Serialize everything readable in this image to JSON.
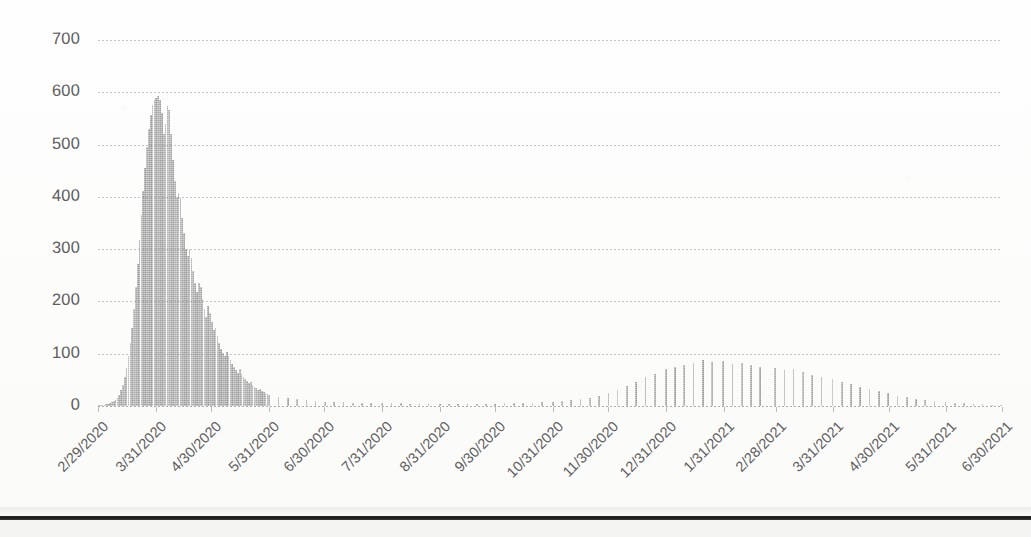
{
  "document": {
    "kind": "scanned-chart-page",
    "page_edge_visible": true
  },
  "chart": {
    "title": "",
    "bar_color": "#a2a2a2",
    "gridline_color": "#969696",
    "tick_label_color": "#5e5e5e"
  },
  "chart_data": {
    "type": "bar",
    "title": "",
    "subtitle": "",
    "xlabel": "",
    "ylabel": "",
    "ylim": [
      0,
      700
    ],
    "ytick_labels": [
      "700",
      "600",
      "500",
      "400",
      "300",
      "200",
      "100",
      "0"
    ],
    "ytick_values": [
      700,
      600,
      500,
      400,
      300,
      200,
      100,
      0
    ],
    "grid": true,
    "legend": "none",
    "xtick_labels": [
      "2/29/2020",
      "3/31/2020",
      "4/30/2020",
      "5/31/2020",
      "6/30/2020",
      "7/31/2020",
      "8/31/2020",
      "9/30/2020",
      "10/31/2020",
      "11/30/2020",
      "12/31/2020",
      "1/31/2021",
      "2/28/2021",
      "3/31/2021",
      "4/30/2021",
      "5/31/2021",
      "6/30/2021"
    ],
    "x_start": "2/29/2020",
    "x_end": "6/30/2021",
    "x_interval": "daily",
    "peak_value": 592,
    "peak_date": "4/1/2020",
    "second_wave_peak_value": 88,
    "second_wave_peak_date": "1/20/2021",
    "categories": [
      "2/29/2020",
      "3/1/2020",
      "3/2/2020",
      "3/3/2020",
      "3/4/2020",
      "3/5/2020",
      "3/6/2020",
      "3/7/2020",
      "3/8/2020",
      "3/9/2020",
      "3/10/2020",
      "3/11/2020",
      "3/12/2020",
      "3/13/2020",
      "3/14/2020",
      "3/15/2020",
      "3/16/2020",
      "3/17/2020",
      "3/18/2020",
      "3/19/2020",
      "3/20/2020",
      "3/21/2020",
      "3/22/2020",
      "3/23/2020",
      "3/24/2020",
      "3/25/2020",
      "3/26/2020",
      "3/27/2020",
      "3/28/2020",
      "3/29/2020",
      "3/30/2020",
      "3/31/2020",
      "4/1/2020",
      "4/2/2020",
      "4/3/2020",
      "4/4/2020",
      "4/5/2020",
      "4/6/2020",
      "4/7/2020",
      "4/8/2020",
      "4/9/2020",
      "4/10/2020",
      "4/11/2020",
      "4/12/2020",
      "4/13/2020",
      "4/14/2020",
      "4/15/2020",
      "4/16/2020",
      "4/17/2020",
      "4/18/2020",
      "4/19/2020",
      "4/20/2020",
      "4/21/2020",
      "4/22/2020",
      "4/23/2020",
      "4/24/2020",
      "4/25/2020",
      "4/26/2020",
      "4/27/2020",
      "4/28/2020",
      "4/29/2020",
      "4/30/2020",
      "5/1/2020",
      "5/2/2020",
      "5/3/2020",
      "5/4/2020",
      "5/5/2020",
      "5/6/2020",
      "5/7/2020",
      "5/8/2020",
      "5/9/2020",
      "5/10/2020",
      "5/11/2020",
      "5/12/2020",
      "5/13/2020",
      "5/14/2020",
      "5/15/2020",
      "5/16/2020",
      "5/17/2020",
      "5/18/2020",
      "5/19/2020",
      "5/20/2020",
      "5/21/2020",
      "5/22/2020",
      "5/23/2020",
      "5/24/2020",
      "5/25/2020",
      "5/26/2020",
      "5/27/2020",
      "5/28/2020",
      "5/29/2020",
      "5/30/2020",
      "5/31/2020",
      "6/5/2020",
      "6/10/2020",
      "6/15/2020",
      "6/20/2020",
      "6/25/2020",
      "6/30/2020",
      "7/5/2020",
      "7/10/2020",
      "7/15/2020",
      "7/20/2020",
      "7/25/2020",
      "7/31/2020",
      "8/5/2020",
      "8/10/2020",
      "8/15/2020",
      "8/20/2020",
      "8/25/2020",
      "8/31/2020",
      "9/5/2020",
      "9/10/2020",
      "9/15/2020",
      "9/20/2020",
      "9/25/2020",
      "9/30/2020",
      "10/5/2020",
      "10/10/2020",
      "10/15/2020",
      "10/20/2020",
      "10/25/2020",
      "10/31/2020",
      "11/5/2020",
      "11/10/2020",
      "11/15/2020",
      "11/20/2020",
      "11/25/2020",
      "11/30/2020",
      "12/5/2020",
      "12/10/2020",
      "12/15/2020",
      "12/20/2020",
      "12/25/2020",
      "12/31/2020",
      "1/5/2021",
      "1/10/2021",
      "1/15/2021",
      "1/20/2021",
      "1/25/2021",
      "1/31/2021",
      "2/5/2021",
      "2/10/2021",
      "2/15/2021",
      "2/20/2021",
      "2/28/2021",
      "3/5/2021",
      "3/10/2021",
      "3/15/2021",
      "3/20/2021",
      "3/25/2021",
      "3/31/2021",
      "4/5/2021",
      "4/10/2021",
      "4/15/2021",
      "4/20/2021",
      "4/25/2021",
      "4/30/2021",
      "5/5/2021",
      "5/10/2021",
      "5/15/2021",
      "5/20/2021",
      "5/25/2021",
      "5/31/2021",
      "6/5/2021",
      "6/10/2021",
      "6/15/2021",
      "6/20/2021",
      "6/25/2021",
      "6/30/2021"
    ],
    "values": [
      1,
      1,
      2,
      2,
      3,
      4,
      5,
      7,
      9,
      12,
      16,
      22,
      30,
      41,
      55,
      72,
      95,
      120,
      150,
      186,
      228,
      272,
      318,
      366,
      412,
      455,
      495,
      530,
      556,
      575,
      586,
      590,
      592,
      585,
      560,
      521,
      540,
      574,
      566,
      520,
      470,
      430,
      400,
      408,
      398,
      360,
      330,
      300,
      286,
      300,
      283,
      258,
      236,
      218,
      236,
      228,
      205,
      186,
      170,
      192,
      178,
      160,
      146,
      150,
      133,
      120,
      110,
      102,
      96,
      104,
      96,
      88,
      80,
      74,
      68,
      64,
      70,
      62,
      56,
      52,
      48,
      44,
      46,
      40,
      37,
      34,
      31,
      33,
      29,
      27,
      25,
      23,
      22,
      18,
      15,
      13,
      11,
      9,
      8,
      7,
      7,
      6,
      6,
      5,
      5,
      5,
      5,
      4,
      4,
      4,
      4,
      4,
      4,
      3,
      4,
      4,
      4,
      5,
      5,
      6,
      6,
      7,
      8,
      9,
      11,
      13,
      16,
      20,
      25,
      31,
      38,
      46,
      55,
      62,
      70,
      74,
      78,
      82,
      88,
      84,
      86,
      80,
      83,
      78,
      74,
      72,
      68,
      70,
      65,
      60,
      56,
      52,
      46,
      42,
      37,
      33,
      28,
      24,
      20,
      17,
      14,
      11,
      9,
      7,
      6,
      5,
      4,
      3,
      2,
      2
    ]
  }
}
